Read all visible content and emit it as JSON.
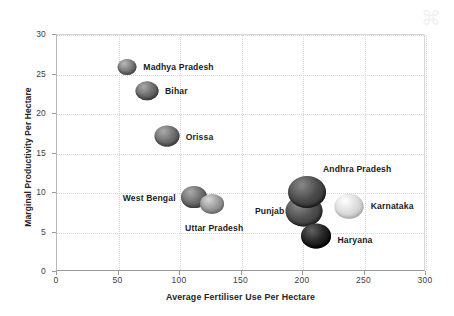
{
  "chart_data": {
    "type": "scatter",
    "title": "",
    "xlabel": "Average Fertiliser Use Per Hectare",
    "ylabel": "Marginal Productivity Per Hectare",
    "xlim": [
      0,
      300
    ],
    "ylim": [
      0,
      30
    ],
    "xticks": [
      "0",
      "50",
      "100",
      "150",
      "200",
      "250",
      "300"
    ],
    "yticks": [
      "0",
      "5",
      "10",
      "15",
      "20",
      "25",
      "30"
    ],
    "grid": true,
    "legend": "none",
    "points": [
      {
        "label": "Madhya Pradesh",
        "x": 58,
        "y": 25.8,
        "size": 19,
        "color": "#7a7a7a",
        "label_anchor": "left",
        "label_dx": 16,
        "label_dy": 0
      },
      {
        "label": "Bihar",
        "x": 74,
        "y": 22.8,
        "size": 23,
        "color": "#6b6b6b",
        "label_anchor": "left",
        "label_dx": 18,
        "label_dy": 0
      },
      {
        "label": "Orissa",
        "x": 90,
        "y": 17.1,
        "size": 25,
        "color": "#6e6e6e",
        "label_anchor": "left",
        "label_dx": 19,
        "label_dy": 1
      },
      {
        "label": "West Bengal",
        "x": 112,
        "y": 9.4,
        "size": 26,
        "color": "#6d6d6d",
        "label_anchor": "right",
        "label_dx": -18,
        "label_dy": 1
      },
      {
        "label": "Uttar Pradesh",
        "x": 127,
        "y": 8.5,
        "size": 24,
        "color": "#9a9a9a",
        "label_anchor": "mid",
        "label_dx": 2,
        "label_dy": 24
      },
      {
        "label": "Punjab",
        "x": 202,
        "y": 7.6,
        "size": 37,
        "color": "#4f4f4f",
        "label_anchor": "right",
        "label_dx": -20,
        "label_dy": 0
      },
      {
        "label": "Andhra Pradesh",
        "x": 204,
        "y": 10.0,
        "size": 38,
        "color": "#4a4a4a",
        "label_anchor": "left",
        "label_dx": 16,
        "label_dy": -23
      },
      {
        "label": "Haryana",
        "x": 211,
        "y": 4.4,
        "size": 30,
        "color": "#232323",
        "label_anchor": "left",
        "label_dx": 22,
        "label_dy": 4
      },
      {
        "label": "Karnataka",
        "x": 238,
        "y": 8.2,
        "size": 29,
        "color": "#dcdcdc",
        "label_anchor": "left",
        "label_dx": 22,
        "label_dy": 0
      }
    ]
  },
  "axes": {
    "x_title": "Average Fertiliser Use Per Hectare",
    "y_title": "Marginal Productivity Per Hectare"
  },
  "watermark": {
    "glyph": "⌘"
  }
}
